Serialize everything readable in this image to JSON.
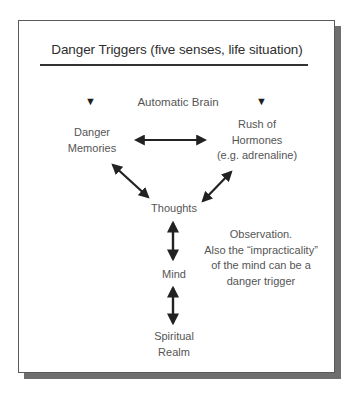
{
  "diagram": {
    "title": "Danger Triggers (five senses, life situation)",
    "header_label": "Automatic Brain",
    "nodes": {
      "danger_memories": {
        "line1": "Danger",
        "line2": "Memories"
      },
      "hormones": {
        "line1": "Rush of",
        "line2": "Hormones",
        "line3": "(e.g. adrenaline)"
      },
      "thoughts": {
        "line1": "Thoughts"
      },
      "mind": {
        "line1": "Mind"
      },
      "spiritual": {
        "line1": "Spiritual",
        "line2": "Realm"
      }
    },
    "note": {
      "line1": "Observation.",
      "line2": "Also the “impracticality”",
      "line3": "of the mind can be a",
      "line4": "danger trigger"
    },
    "icons": {
      "left_triangle": "▼",
      "right_triangle": "▼"
    },
    "edges": [
      {
        "from": "Danger Memories",
        "to": "Rush of Hormones",
        "type": "bidirectional"
      },
      {
        "from": "Danger Memories",
        "to": "Thoughts",
        "type": "bidirectional"
      },
      {
        "from": "Rush of Hormones",
        "to": "Thoughts",
        "type": "bidirectional"
      },
      {
        "from": "Thoughts",
        "to": "Mind",
        "type": "bidirectional"
      },
      {
        "from": "Mind",
        "to": "Spiritual Realm",
        "type": "bidirectional"
      }
    ]
  }
}
